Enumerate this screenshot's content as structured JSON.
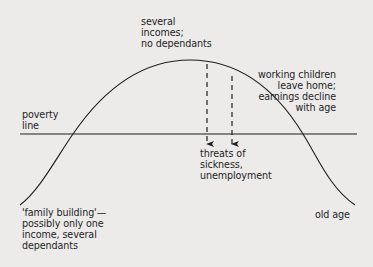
{
  "diagram": {
    "title": "",
    "colors": {
      "background": "#ecebea",
      "ink": "#1e1e1e"
    },
    "curve": {
      "description": "income over life cycle",
      "points": [
        [
          20,
          205
        ],
        [
          73,
          134
        ],
        [
          190,
          60
        ],
        [
          303,
          134
        ],
        [
          355,
          205
        ]
      ]
    },
    "poverty_line": {
      "label": "poverty\nline",
      "y": 134,
      "x_start": 20,
      "x_end": 357
    },
    "dashed_arrows": [
      {
        "x": 207,
        "y_start": 64,
        "y_end": 148
      },
      {
        "x": 232,
        "y_start": 76,
        "y_end": 148
      }
    ],
    "annotations": {
      "peak": "several\nincomes;\nno dependants",
      "decline": "working children\nleave home;\nearnings decline\nwith age",
      "threats": "threats of\nsickness,\nunemployment",
      "family_building": "'family building'—\npossibly only one\nincome, several\ndependants",
      "old_age": "old age"
    }
  }
}
